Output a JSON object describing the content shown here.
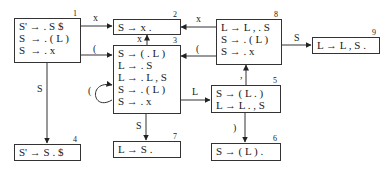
{
  "states": [
    {
      "id": "1",
      "number": "1",
      "items": [
        "S' → . S $",
        "S  → . ( L )",
        "S  → . x"
      ]
    },
    {
      "id": "2",
      "number": "2",
      "items": [
        "S → x ."
      ]
    },
    {
      "id": "3",
      "number": "3",
      "items": [
        "S → ( . L )",
        "L → . S",
        "L → . L , S",
        "S → . ( L )",
        "S → . x"
      ]
    },
    {
      "id": "4",
      "number": "4",
      "items": [
        "S' → S . $"
      ]
    },
    {
      "id": "5",
      "number": "5",
      "items": [
        "S → ( L . )",
        "L → L . , S"
      ]
    },
    {
      "id": "6",
      "number": "6",
      "items": [
        "S → ( L ) ."
      ]
    },
    {
      "id": "7",
      "number": "7",
      "items": [
        "L → S ."
      ]
    },
    {
      "id": "8",
      "number": "8",
      "items": [
        "L → L , . S",
        "S → . ( L )",
        "S → . x"
      ]
    },
    {
      "id": "9",
      "number": "9",
      "items": [
        "L → L , S ."
      ]
    }
  ],
  "edges": [
    {
      "from": "1",
      "to": "2",
      "label": "x"
    },
    {
      "from": "1",
      "to": "3",
      "label": "("
    },
    {
      "from": "1",
      "to": "4",
      "label": "S"
    },
    {
      "from": "3",
      "to": "2",
      "label": "x"
    },
    {
      "from": "3",
      "to": "3",
      "label": "("
    },
    {
      "from": "3",
      "to": "5",
      "label": "L"
    },
    {
      "from": "3",
      "to": "7",
      "label": "S"
    },
    {
      "from": "5",
      "to": "6",
      "label": ")"
    },
    {
      "from": "5",
      "to": "8",
      "label": ","
    },
    {
      "from": "8",
      "to": "2",
      "label": "x"
    },
    {
      "from": "8",
      "to": "3",
      "label": "("
    },
    {
      "from": "8",
      "to": "9",
      "label": "S"
    }
  ]
}
